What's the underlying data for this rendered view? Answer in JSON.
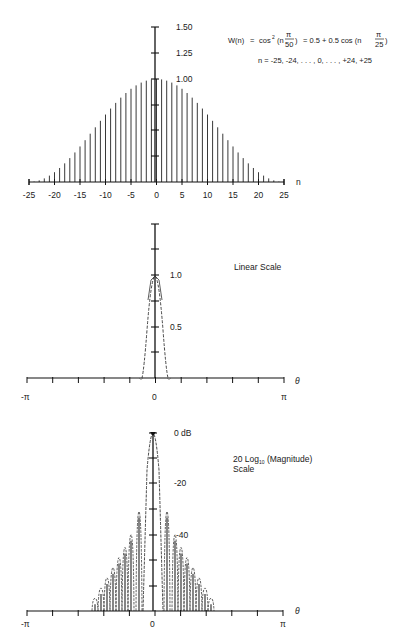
{
  "chart_data": [
    {
      "id": "window",
      "type": "bar",
      "title": "W(n) = cos² (nπ/50) = 0.5 + 0.5 cos (nπ/25)",
      "subtitle": "n = -25, -24, . . . , 0, . . . , +24, +25",
      "xlabel": "n",
      "ylabel": "",
      "x_ticks": [
        -25,
        -20,
        -15,
        -10,
        -5,
        0,
        5,
        10,
        15,
        20,
        25
      ],
      "y_tick_labels": [
        "1.50",
        "1.25",
        "1.00"
      ],
      "ylim": [
        0,
        1.5
      ],
      "xlim": [
        -25,
        25
      ],
      "grid": false,
      "x": [
        -25,
        -24,
        -23,
        -22,
        -21,
        -20,
        -19,
        -18,
        -17,
        -16,
        -15,
        -14,
        -13,
        -12,
        -11,
        -10,
        -9,
        -8,
        -7,
        -6,
        -5,
        -4,
        -3,
        -2,
        -1,
        0,
        1,
        2,
        3,
        4,
        5,
        6,
        7,
        8,
        9,
        10,
        11,
        12,
        13,
        14,
        15,
        16,
        17,
        18,
        19,
        20,
        21,
        22,
        23,
        24,
        25
      ],
      "values": [
        0.0,
        0.004,
        0.016,
        0.035,
        0.062,
        0.095,
        0.136,
        0.181,
        0.232,
        0.287,
        0.345,
        0.406,
        0.469,
        0.531,
        0.594,
        0.655,
        0.713,
        0.768,
        0.819,
        0.864,
        0.905,
        0.938,
        0.965,
        0.984,
        0.996,
        1.0,
        0.996,
        0.984,
        0.965,
        0.938,
        0.905,
        0.864,
        0.819,
        0.768,
        0.713,
        0.655,
        0.594,
        0.531,
        0.469,
        0.406,
        0.345,
        0.287,
        0.232,
        0.181,
        0.136,
        0.095,
        0.062,
        0.035,
        0.016,
        0.004,
        0.0
      ]
    },
    {
      "id": "linear",
      "type": "line",
      "annotation": "Linear Scale",
      "xlabel": "θ",
      "x_tick_labels": [
        "-π",
        "0",
        "π"
      ],
      "y_tick_labels": [
        "1.0",
        "0.5"
      ],
      "xlim": [
        "-π",
        "π"
      ],
      "ylim": [
        0,
        1.5
      ],
      "grid": false,
      "description": "Narrow main lobe centered at θ=0 with peak 1.0, width about ±0.25 rad; side lobes negligible"
    },
    {
      "id": "log",
      "type": "line",
      "annotation": "20 Log10 (Magnitude) Scale",
      "xlabel": "θ",
      "x_tick_labels": [
        "-π",
        "0",
        "π"
      ],
      "y_tick_labels": [
        "0 dB",
        "-20",
        "-40"
      ],
      "xlim": [
        "-π",
        "π"
      ],
      "ylim": [
        -70,
        0
      ],
      "grid": false,
      "description": "Main lobe peak 0 dB at θ=0; side lobes starting near -31 dB decaying to about -70 dB by θ≈±0.4π"
    }
  ],
  "labels": {
    "top": {
      "formula_lhs": "W(n)",
      "formula_eq": "=",
      "formula_cos": "cos",
      "formula_sq": "2",
      "formula_open": "(n",
      "pi": "π",
      "d50": "50",
      "formula_rhs": "=  0.5 + 0.5 cos (n",
      "d25": "25",
      "range": "n  =  -25, -24, . . . , 0, . . . , +24, +25",
      "y150": "1.50",
      "y125": "1.25",
      "y100": "1.00",
      "xaxis": "n",
      "xt": [
        "-25",
        "-20",
        "-15",
        "-10",
        "-5",
        "0",
        "5",
        "10",
        "15",
        "20",
        "25"
      ]
    },
    "mid": {
      "title": "Linear Scale",
      "y10": "1.0",
      "y05": "0.5",
      "xaxis": "θ",
      "xmin": "-π",
      "x0": "0",
      "xmax": "π"
    },
    "bot": {
      "title_line1a": "20 Log",
      "title_sub": "10",
      "title_line1b": " (Magnitude)",
      "title_line2": "Scale",
      "y0": "0 dB",
      "y20": "-20",
      "y40": "-40",
      "xaxis": "θ",
      "xmin": "-π",
      "x0": "0",
      "xmax": "π"
    }
  }
}
